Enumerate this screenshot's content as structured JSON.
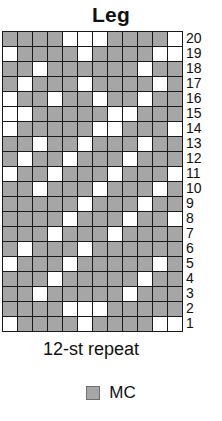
{
  "title": "Leg",
  "repeat_label": "12-st repeat",
  "legend": {
    "swatch_name": "mc-swatch",
    "label": "MC"
  },
  "colors": {
    "mc": "#a6a6a6",
    "cc": "#ffffff",
    "grid_line": "#1a1a1a",
    "text": "#111111"
  },
  "chart_data": {
    "type": "heatmap",
    "title": "Leg",
    "xlabel": "12-st repeat",
    "ylabel": "",
    "columns": 12,
    "rows": 20,
    "row_labels": [
      "20",
      "19",
      "18",
      "17",
      "16",
      "15",
      "14",
      "13",
      "12",
      "11",
      "10",
      "9",
      "8",
      "7",
      "6",
      "5",
      "4",
      "3",
      "2",
      "1"
    ],
    "legend_entries": [
      {
        "label": "MC",
        "color": "#a6a6a6"
      }
    ],
    "cell_values": {
      "mc": 1,
      "cc": 0
    },
    "grid": [
      {
        "row": "20",
        "cells": [
          1,
          1,
          1,
          1,
          0,
          0,
          0,
          1,
          1,
          1,
          1,
          0
        ]
      },
      {
        "row": "19",
        "cells": [
          0,
          1,
          1,
          1,
          1,
          0,
          1,
          1,
          1,
          1,
          0,
          0
        ]
      },
      {
        "row": "18",
        "cells": [
          1,
          1,
          0,
          1,
          1,
          1,
          1,
          1,
          1,
          0,
          1,
          1
        ]
      },
      {
        "row": "17",
        "cells": [
          1,
          0,
          1,
          1,
          1,
          0,
          1,
          1,
          1,
          1,
          0,
          1
        ]
      },
      {
        "row": "16",
        "cells": [
          0,
          1,
          1,
          0,
          1,
          1,
          0,
          1,
          1,
          0,
          1,
          1
        ]
      },
      {
        "row": "15",
        "cells": [
          0,
          0,
          1,
          1,
          1,
          1,
          1,
          0,
          0,
          1,
          1,
          1
        ]
      },
      {
        "row": "14",
        "cells": [
          0,
          1,
          1,
          1,
          1,
          1,
          0,
          0,
          1,
          1,
          1,
          0
        ]
      },
      {
        "row": "13",
        "cells": [
          1,
          1,
          0,
          1,
          1,
          0,
          1,
          1,
          1,
          0,
          1,
          1
        ]
      },
      {
        "row": "12",
        "cells": [
          1,
          0,
          1,
          1,
          0,
          1,
          1,
          1,
          0,
          1,
          1,
          1
        ]
      },
      {
        "row": "11",
        "cells": [
          0,
          1,
          1,
          0,
          1,
          1,
          1,
          0,
          1,
          1,
          1,
          0
        ]
      },
      {
        "row": "10",
        "cells": [
          1,
          1,
          0,
          1,
          1,
          1,
          0,
          1,
          1,
          1,
          0,
          1
        ]
      },
      {
        "row": "9",
        "cells": [
          1,
          1,
          1,
          1,
          1,
          0,
          1,
          1,
          1,
          0,
          1,
          1
        ]
      },
      {
        "row": "8",
        "cells": [
          1,
          1,
          1,
          1,
          0,
          1,
          1,
          1,
          0,
          1,
          1,
          0
        ]
      },
      {
        "row": "7",
        "cells": [
          1,
          1,
          1,
          0,
          1,
          1,
          1,
          0,
          1,
          1,
          1,
          1
        ]
      },
      {
        "row": "6",
        "cells": [
          1,
          0,
          1,
          1,
          1,
          0,
          1,
          1,
          1,
          1,
          1,
          1
        ]
      },
      {
        "row": "5",
        "cells": [
          0,
          1,
          1,
          1,
          0,
          1,
          1,
          1,
          1,
          1,
          0,
          1
        ]
      },
      {
        "row": "4",
        "cells": [
          1,
          1,
          1,
          0,
          1,
          1,
          1,
          1,
          1,
          0,
          1,
          1
        ]
      },
      {
        "row": "3",
        "cells": [
          1,
          1,
          0,
          1,
          1,
          1,
          1,
          1,
          0,
          1,
          1,
          1
        ]
      },
      {
        "row": "2",
        "cells": [
          1,
          1,
          1,
          1,
          0,
          0,
          0,
          1,
          1,
          1,
          1,
          1
        ]
      },
      {
        "row": "1",
        "cells": [
          0,
          1,
          1,
          1,
          1,
          0,
          1,
          1,
          1,
          1,
          0,
          0
        ]
      }
    ]
  }
}
